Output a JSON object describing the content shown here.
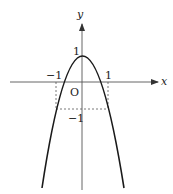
{
  "diagram": {
    "type": "function-graph",
    "function": "y = 1 - 2x^2 (downward parabola)",
    "axes": {
      "x_label": "x",
      "y_label": "y",
      "origin_label": "O"
    },
    "tick_labels": {
      "x_neg": "−1",
      "x_pos": "1",
      "y_pos": "1",
      "y_neg": "−1"
    },
    "colors": {
      "curve": "#1a1a1a",
      "axis": "#333333",
      "dashed": "#555555"
    }
  }
}
